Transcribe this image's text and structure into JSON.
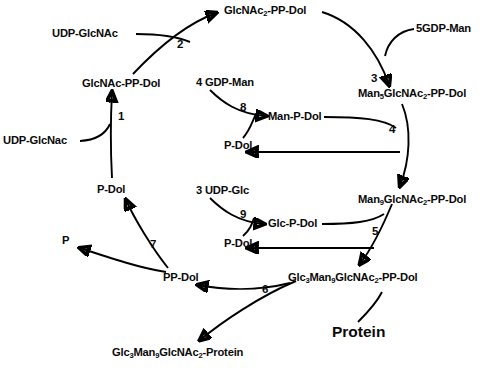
{
  "diagram": {
    "nodes": {
      "udp_glcnac_top": "UDP-GlcNAc",
      "glcnac2_pp_dol": "GlcNAc",
      "glcnac2_pp_dol_sub": "2",
      "glcnac2_pp_dol_tail": "-PP-Dol",
      "gdp_man_5": "5GDP-Man",
      "glcnac_pp_dol": "GlcNAc-PP-Dol",
      "udp_glcnac_bottom": "UDP-GlcNac",
      "gdp_man_4": "4 GDP-Man",
      "man_p_dol": "Man-P-Dol",
      "p_dol_mid_upper": "P-Dol",
      "man5_prefix": "Man",
      "man5_sub": "5",
      "man5_mid": "GlcNAc",
      "man5_sub2": "2",
      "man5_tail": "-PP-Dol",
      "udp_glc_3": "3 UDP-Glc",
      "glc_p_dol": "Glc-P-Dol",
      "p_dol_mid_lower": "P-Dol",
      "man9_prefix": "Man",
      "man9_sub": "9",
      "man9_mid": "GlcNAc",
      "man9_sub2": "2",
      "man9_tail": "-PP-Dol",
      "p_dol_left": "P-Dol",
      "p_release": "P",
      "pp_dol": "PP-Dol",
      "glc3man9_pp_dol_a": "Glc",
      "glc3man9_pp_dol_a_sub": "3",
      "glc3man9_pp_dol_b": "Man",
      "glc3man9_pp_dol_b_sub": "9",
      "glc3man9_pp_dol_c": "GlcNAc",
      "glc3man9_pp_dol_c_sub": "2",
      "glc3man9_pp_dol_tail": "-PP-Dol",
      "protein": "Protein",
      "glc3man9_protein_a": "Glc",
      "glc3man9_protein_a_sub": "3",
      "glc3man9_protein_b": "Man",
      "glc3man9_protein_b_sub": "9",
      "glc3man9_protein_c": "GlcNAc",
      "glc3man9_protein_c_sub": "2",
      "glc3man9_protein_tail": "-Protein"
    },
    "steps": {
      "s1": "1",
      "s2": "2",
      "s3": "3",
      "s4": "4",
      "s5": "5",
      "s6": "6",
      "s7": "7",
      "s8": "8",
      "s9": "9"
    },
    "colors": {
      "stroke": "#000000",
      "text": "#0a0a0a",
      "background": "#ffffff"
    }
  }
}
